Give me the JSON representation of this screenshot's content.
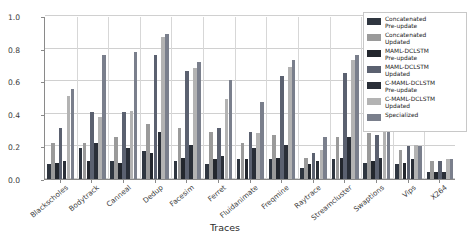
{
  "chart_data": {
    "type": "bar",
    "title": "",
    "xlabel": "Traces",
    "ylabel": "Test Accuracy",
    "ylim": [
      0.0,
      1.0
    ],
    "yticks": [
      "0.0",
      "0.2",
      "0.4",
      "0.6",
      "0.8",
      "1.0"
    ],
    "ytick_values": [
      0.0,
      0.2,
      0.4,
      0.6,
      0.8,
      1.0
    ],
    "grid": true,
    "legend_position": "upper right",
    "categories": [
      "Blackscholes",
      "Bodytrack",
      "Canneal",
      "Dedup",
      "Facesim",
      "Ferret",
      "Fluidanimate",
      "Freqmine",
      "Raytrace",
      "Streamcluster",
      "Swaptions",
      "Vips",
      "X264"
    ],
    "series": [
      {
        "name": "Concatenated Pre-update",
        "color": "#2f3640",
        "values": [
          0.09,
          0.19,
          0.11,
          0.17,
          0.11,
          0.09,
          0.12,
          0.12,
          0.07,
          0.12,
          0.1,
          0.09,
          0.04
        ]
      },
      {
        "name": "Concatenated Updated",
        "color": "#9a9a9a",
        "values": [
          0.22,
          0.22,
          0.26,
          0.34,
          0.31,
          0.29,
          0.22,
          0.27,
          0.13,
          0.26,
          0.28,
          0.18,
          0.11
        ]
      },
      {
        "name": "MAML-DCLSTM Pre-update",
        "color": "#23272e",
        "values": [
          0.1,
          0.11,
          0.1,
          0.16,
          0.13,
          0.12,
          0.12,
          0.13,
          0.09,
          0.13,
          0.11,
          0.1,
          0.04
        ]
      },
      {
        "name": "MAML-DCLSTM Updated",
        "color": "#5b6170",
        "values": [
          0.31,
          0.41,
          0.41,
          0.76,
          0.66,
          0.31,
          0.29,
          0.63,
          0.16,
          0.65,
          0.27,
          0.2,
          0.11
        ]
      },
      {
        "name": "C-MAML-DCLSTM Pre-update",
        "color": "#2a2f38",
        "values": [
          0.11,
          0.22,
          0.19,
          0.29,
          0.21,
          0.14,
          0.19,
          0.21,
          0.11,
          0.26,
          0.13,
          0.12,
          0.04
        ]
      },
      {
        "name": "C-MAML-DCLSTM Updated",
        "color": "#b3b3b3",
        "values": [
          0.51,
          0.38,
          0.42,
          0.87,
          0.68,
          0.49,
          0.28,
          0.69,
          0.18,
          0.73,
          0.31,
          0.21,
          0.12
        ]
      },
      {
        "name": "Specialized",
        "color": "#7a7f8c",
        "values": [
          0.55,
          0.76,
          0.78,
          0.89,
          0.72,
          0.61,
          0.47,
          0.73,
          0.26,
          0.76,
          0.59,
          0.2,
          0.12
        ]
      }
    ]
  },
  "legend": {
    "entries": [
      {
        "label": "Concatenated\nPre-update",
        "color": "#2f3640"
      },
      {
        "label": "Concatenated\nUpdated",
        "color": "#9a9a9a"
      },
      {
        "label": "MAML-DCLSTM\nPre-update",
        "color": "#23272e"
      },
      {
        "label": "MAML-DCLSTM\nUpdated",
        "color": "#5b6170"
      },
      {
        "label": "C-MAML-DCLSTM\nPre-update",
        "color": "#2a2f38"
      },
      {
        "label": "C-MAML-DCLSTM\nUpdated",
        "color": "#b3b3b3"
      },
      {
        "label": "Specialized",
        "color": "#7a7f8c"
      }
    ]
  }
}
